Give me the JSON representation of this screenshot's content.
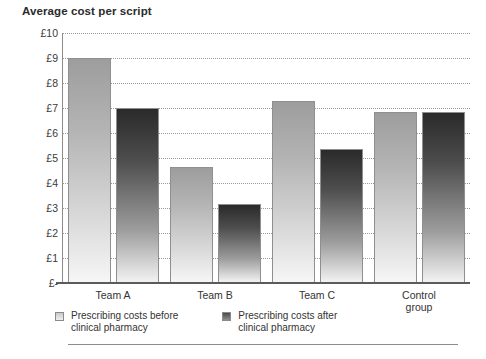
{
  "chart_data": {
    "type": "bar",
    "title": "Average cost per script",
    "xlabel": "",
    "ylabel": "",
    "ylim": [
      0,
      10
    ],
    "grid": true,
    "legend_position": "bottom-left",
    "categories": [
      "Team A",
      "Team B",
      "Team C",
      "Control group"
    ],
    "tick_labels": [
      "£10",
      "£9",
      "£8",
      "£7",
      "£6",
      "£5",
      "£4",
      "£3",
      "£2",
      "£1",
      "£-"
    ],
    "tick_values": [
      10,
      9,
      8,
      7,
      6,
      5,
      4,
      3,
      2,
      1,
      0
    ],
    "currency_symbol": "£",
    "series": [
      {
        "name": "Prescribing costs before clinical pharmacy",
        "key": "before",
        "color": "#b4b4b4",
        "values": [
          9.0,
          4.65,
          7.3,
          6.85
        ]
      },
      {
        "name": "Prescribing costs after clinical pharmacy",
        "key": "after",
        "color": "#3a3a3a",
        "values": [
          7.0,
          3.15,
          5.35,
          6.85
        ]
      }
    ]
  },
  "legend": {
    "items": [
      {
        "label": "Prescribing costs before\nclinical pharmacy",
        "swatch": "before"
      },
      {
        "label": "Prescribing costs after\nclinical pharmacy",
        "swatch": "after"
      }
    ]
  }
}
